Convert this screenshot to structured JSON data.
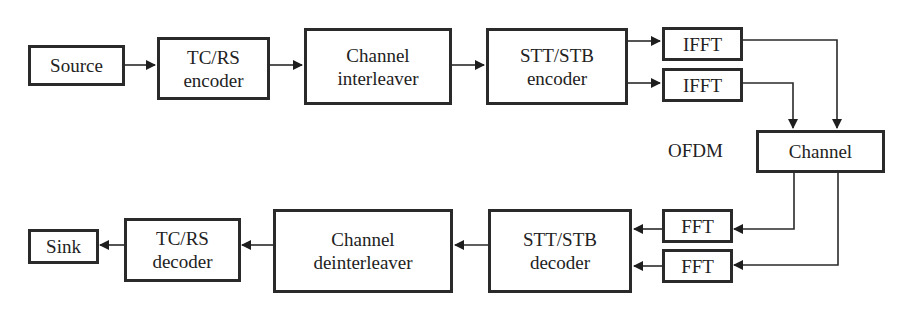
{
  "diagram": {
    "type": "block-diagram",
    "transmitter": {
      "source": "Source",
      "outer_encoder": [
        "TC/RS",
        "encoder"
      ],
      "interleaver": [
        "Channel",
        "interleaver"
      ],
      "stc_encoder": [
        "STT/STB",
        "encoder"
      ],
      "ifft_1": "IFFT",
      "ifft_2": "IFFT"
    },
    "channel": "Channel",
    "ofdm_label": "OFDM",
    "receiver": {
      "fft_1": "FFT",
      "fft_2": "FFT",
      "stc_decoder": [
        "STT/STB",
        "decoder"
      ],
      "deinterleaver": [
        "Channel",
        "deinterleaver"
      ],
      "outer_decoder": [
        "TC/RS",
        "decoder"
      ],
      "sink": "Sink"
    },
    "edges": [
      [
        "Source",
        "TC/RS encoder"
      ],
      [
        "TC/RS encoder",
        "Channel interleaver"
      ],
      [
        "Channel interleaver",
        "STT/STB encoder"
      ],
      [
        "STT/STB encoder",
        "IFFT (1)"
      ],
      [
        "STT/STB encoder",
        "IFFT (2)"
      ],
      [
        "IFFT (1)",
        "Channel"
      ],
      [
        "IFFT (2)",
        "Channel"
      ],
      [
        "Channel",
        "FFT (1)"
      ],
      [
        "Channel",
        "FFT (2)"
      ],
      [
        "FFT (1)",
        "STT/STB decoder"
      ],
      [
        "FFT (2)",
        "STT/STB decoder"
      ],
      [
        "STT/STB decoder",
        "Channel deinterleaver"
      ],
      [
        "Channel deinterleaver",
        "TC/RS decoder"
      ],
      [
        "TC/RS decoder",
        "Sink"
      ]
    ]
  }
}
